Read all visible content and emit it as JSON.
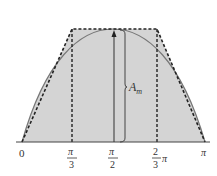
{
  "diagram": {
    "amplitude_label": "A",
    "amplitude_sub": "m",
    "x_ticks": [
      {
        "num": "0",
        "den": ""
      },
      {
        "num": "π",
        "den": "3"
      },
      {
        "num": "π",
        "den": "2"
      },
      {
        "num": "2",
        "den": "3",
        "suffix": "π"
      },
      {
        "num": "π",
        "den": ""
      }
    ],
    "colors": {
      "fill": "#d4d4d4",
      "curve": "#777777",
      "dashed": "#222222",
      "axis": "#444444"
    }
  }
}
